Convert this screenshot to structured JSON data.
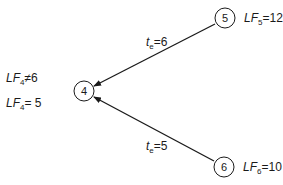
{
  "diagram": {
    "type": "network-node-latest-finish",
    "nodes": [
      {
        "id": "4",
        "label": "4",
        "cx": 84,
        "cy": 91
      },
      {
        "id": "5",
        "label": "5",
        "cx": 225,
        "cy": 18
      },
      {
        "id": "6",
        "label": "6",
        "cx": 224,
        "cy": 167
      }
    ],
    "edges": [
      {
        "from": "5",
        "to": "4",
        "label_var": "t",
        "label_sub": "e",
        "label_val": "=6"
      },
      {
        "from": "6",
        "to": "4",
        "label_var": "t",
        "label_sub": "e",
        "label_val": "=5"
      }
    ],
    "annotations": {
      "node5": {
        "var": "LF",
        "sub": "5",
        "val": "=12"
      },
      "node6": {
        "var": "LF",
        "sub": "6",
        "val": "=10"
      },
      "node4_rejected": {
        "var": "LF",
        "sub": "4",
        "val": "≠6"
      },
      "node4_result": {
        "var": "LF",
        "sub": "4",
        "val": "= 5"
      }
    },
    "colors": {
      "line": "#1a1a1a",
      "background": "#ffffff"
    }
  }
}
